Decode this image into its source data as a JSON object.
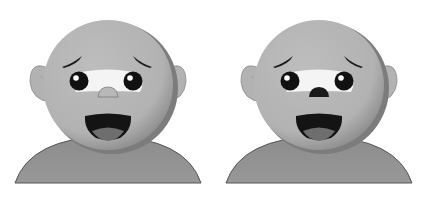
{
  "figure": {
    "panels": [
      {
        "id": "left",
        "label": "face with light nose",
        "offset_x": 0,
        "nose_color": "#b8b8b8",
        "nose_stroke": "#7a7a7a"
      },
      {
        "id": "right",
        "label": "face with dark nose",
        "offset_x": 211,
        "nose_color": "#1a1a1a",
        "nose_stroke": "#1a1a1a"
      }
    ],
    "colors": {
      "background": "#ffffff",
      "head": "#b4b4b4",
      "head_shadow": "#7c7c7c",
      "body": "#8e8e8e",
      "body_outline": "#555555",
      "eye_white": "#f4f4f4",
      "pupil": "#111111",
      "mouth": "#141414",
      "tongue": "#6e6e6e",
      "brow": "#1c1c1c",
      "ear": "#b2b2b2"
    }
  }
}
